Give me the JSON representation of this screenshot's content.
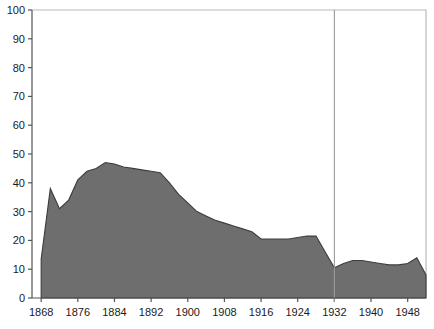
{
  "chart_data": {
    "type": "area",
    "title": "",
    "subtitle": "",
    "xlabel": "",
    "ylabel": "",
    "xlim": [
      1866,
      1952
    ],
    "ylim": [
      0,
      100
    ],
    "grid": false,
    "legend": null,
    "legend_position": "none",
    "series_name": "value",
    "x": [
      1868,
      1870,
      1872,
      1874,
      1876,
      1878,
      1880,
      1882,
      1884,
      1886,
      1888,
      1890,
      1892,
      1894,
      1896,
      1898,
      1900,
      1902,
      1904,
      1906,
      1908,
      1910,
      1912,
      1914,
      1916,
      1918,
      1920,
      1922,
      1924,
      1926,
      1928,
      1930,
      1932,
      1934,
      1936,
      1938,
      1940,
      1942,
      1944,
      1946,
      1948,
      1950,
      1952
    ],
    "values": [
      13.5,
      38,
      31,
      34,
      41,
      44,
      45,
      47,
      46.5,
      45.5,
      45,
      44.5,
      44,
      43.5,
      40,
      36,
      33,
      30,
      28.5,
      27,
      26,
      25,
      24,
      23,
      20.5,
      20.5,
      20.5,
      20.5,
      21,
      21.5,
      21.5,
      16,
      10.5,
      12,
      13,
      13,
      12.5,
      12,
      11.5,
      11.5,
      12,
      14,
      8
    ],
    "annotations": [
      {
        "type": "vertical-reference-line",
        "x": 1932,
        "label": ""
      }
    ],
    "axes": {
      "y_ticks": [
        0,
        10,
        20,
        30,
        40,
        50,
        60,
        70,
        80,
        90,
        100
      ],
      "y_tick_labels": [
        "0",
        "10",
        "20",
        "30",
        "40",
        "50",
        "60",
        "70",
        "80",
        "90",
        "100"
      ],
      "x_ticks": [
        1868,
        1876,
        1884,
        1892,
        1900,
        1908,
        1916,
        1924,
        1932,
        1940,
        1948
      ],
      "x_tick_labels": [
        "1868",
        "1876",
        "1884",
        "1892",
        "1900",
        "1908",
        "1916",
        "1924",
        "1932",
        "1940",
        "1948"
      ]
    },
    "colors": {
      "area_fill": "#6e6e6e",
      "area_stroke": "#3d3d3d",
      "axis": "#555555",
      "frame": "#b9b9b9",
      "reference_line": "#9a9a9a",
      "text": "#1a1a1a",
      "background": "#ffffff"
    }
  }
}
